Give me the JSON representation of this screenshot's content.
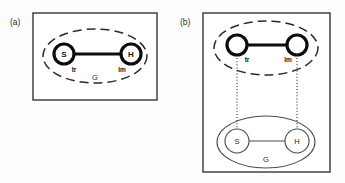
{
  "figure": {
    "background_color": "#fdfdfd",
    "ink_color": "#141414",
    "panels": [
      {
        "id": "panel-a",
        "tag": "(a)",
        "frame": {
          "x": 33,
          "y": 13,
          "width": 124,
          "height": 87
        },
        "groups": [
          {
            "id": "group-a-dashed",
            "style": "dashed",
            "label": "G",
            "label_x": 95,
            "label_y": 80,
            "cx": 95,
            "cy": 56,
            "rx": 52,
            "ry": 27
          }
        ],
        "nodes": [
          {
            "id": "node-a-s",
            "label": "S",
            "role_label": "tr",
            "style": "bold",
            "cx": 64,
            "cy": 54,
            "r": 10
          },
          {
            "id": "node-a-h",
            "label": "H",
            "role_label": "lm",
            "style": "bold",
            "cx": 131,
            "cy": 54,
            "r": 10
          }
        ],
        "edges": [
          {
            "id": "edge-a-sh",
            "style": "bold",
            "x1": 74,
            "y1": 54,
            "x2": 121,
            "y2": 54
          }
        ],
        "links": []
      },
      {
        "id": "panel-b",
        "tag": "(b)",
        "frame": {
          "x": 203,
          "y": 13,
          "width": 127,
          "height": 159
        },
        "groups": [
          {
            "id": "group-b-dashed",
            "style": "dashed",
            "label": "",
            "label_x": 0,
            "label_y": 0,
            "cx": 266,
            "cy": 48,
            "rx": 52,
            "ry": 27
          },
          {
            "id": "group-b-solid",
            "style": "solid",
            "label": "G",
            "label_x": 266,
            "label_y": 159,
            "cx": 266,
            "cy": 142,
            "rx": 49,
            "ry": 26
          }
        ],
        "nodes": [
          {
            "id": "node-b-top-tr",
            "label": "",
            "role_label": "tr",
            "style": "bold",
            "cx": 237,
            "cy": 45,
            "r": 10
          },
          {
            "id": "node-b-top-lm",
            "label": "",
            "role_label": "lm",
            "style": "bold",
            "cx": 297,
            "cy": 45,
            "r": 10
          },
          {
            "id": "node-b-bottom-s",
            "label": "S",
            "role_label": "",
            "style": "thin",
            "cx": 237,
            "cy": 141,
            "r": 12
          },
          {
            "id": "node-b-bottom-h",
            "label": "H",
            "role_label": "",
            "style": "thin",
            "cx": 297,
            "cy": 141,
            "r": 12
          }
        ],
        "edges": [
          {
            "id": "edge-b-top",
            "style": "bold",
            "x1": 247,
            "y1": 45,
            "x2": 287,
            "y2": 45
          },
          {
            "id": "edge-b-bottom",
            "style": "thin",
            "x1": 249,
            "y1": 141,
            "x2": 285,
            "y2": 141
          }
        ],
        "links": [
          {
            "id": "link-b-tr",
            "style": "dotted",
            "x1": 237,
            "y1": 55,
            "x2": 237,
            "y2": 129
          },
          {
            "id": "link-b-lm",
            "style": "dotted",
            "x1": 297,
            "y1": 55,
            "x2": 297,
            "y2": 129
          }
        ]
      }
    ]
  },
  "legend_terms": {
    "trajector": "tr",
    "landmark": "lm",
    "ground": "G",
    "subject": "S",
    "head": "H"
  }
}
